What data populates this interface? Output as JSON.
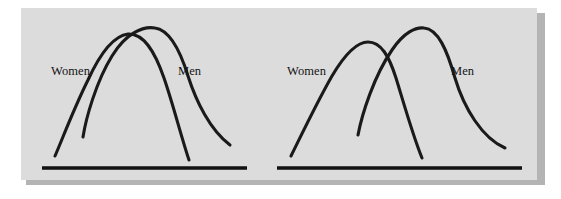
{
  "figure": {
    "background_color": "#ffffff",
    "panel_color": "#dcdcdc",
    "shadow_color": "#b4b4b4",
    "ink_color": "#1a1a1a"
  },
  "panels": [
    {
      "id": "left-panel",
      "name": "high-overlap-panel",
      "description": "Two nearly coincident bell curves with large overlap",
      "baseline": {
        "x1": 42,
        "x2": 247,
        "y": 168
      },
      "curves": [
        {
          "name": "women",
          "label": "Women",
          "label_x": 51,
          "label_y": 64,
          "peak_x": 128,
          "peak_y": 34,
          "start_x": 55,
          "start_y": 156,
          "end_x": 189,
          "end_y": 160,
          "path": "M55,156 C62,140 74,108 88,80 C99,56 112,36 128,34 C144,33 155,52 164,78 C173,104 181,136 189,160"
        },
        {
          "name": "men",
          "label": "Men",
          "label_x": 178,
          "label_y": 64,
          "peak_x": 155,
          "peak_y": 28,
          "start_x": 83,
          "start_y": 137,
          "end_x": 230,
          "end_y": 145,
          "path": "M83,137 C86,118 96,82 112,56 C126,33 143,26 155,28 C170,30 180,50 188,76 C196,101 210,130 230,145"
        }
      ]
    },
    {
      "id": "right-panel",
      "name": "low-overlap-panel",
      "description": "Two separated bell curves with smaller overlap",
      "baseline": {
        "x1": 277,
        "x2": 522,
        "y": 168
      },
      "curves": [
        {
          "name": "women",
          "label": "Women",
          "label_x": 287,
          "label_y": 64,
          "peak_x": 368,
          "peak_y": 42,
          "start_x": 291,
          "start_y": 156,
          "end_x": 422,
          "end_y": 158,
          "path": "M291,156 C300,138 316,104 332,76 C345,54 357,42 368,42 C381,42 389,56 396,78 C404,104 413,136 422,158"
        },
        {
          "name": "men",
          "label": "Men",
          "label_x": 451,
          "label_y": 64,
          "peak_x": 424,
          "peak_y": 28,
          "start_x": 358,
          "start_y": 135,
          "end_x": 505,
          "end_y": 148,
          "path": "M358,135 C362,114 374,76 392,50 C404,32 416,27 424,28 C438,29 447,50 455,78 C464,108 482,138 505,148"
        }
      ]
    }
  ],
  "chart_data": {
    "type": "line",
    "xlabel": "",
    "ylabel": "",
    "grid": false,
    "legend": "inline-annotations",
    "panels": [
      {
        "name": "high-overlap",
        "series": [
          {
            "name": "Women",
            "peak_x": 128,
            "peak_height": 134,
            "spread": "wide"
          },
          {
            "name": "Men",
            "peak_x": 155,
            "peak_height": 140,
            "spread": "wide"
          }
        ],
        "overlap": "large"
      },
      {
        "name": "low-overlap",
        "series": [
          {
            "name": "Women",
            "peak_x": 368,
            "peak_height": 126,
            "spread": "narrow"
          },
          {
            "name": "Men",
            "peak_x": 424,
            "peak_height": 140,
            "spread": "narrow"
          }
        ],
        "overlap": "small"
      }
    ]
  }
}
